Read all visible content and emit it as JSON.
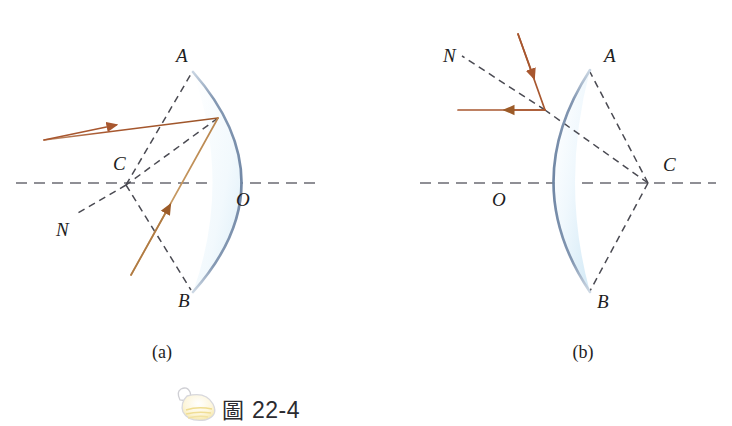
{
  "figure": {
    "caption_icon": "bulb-flask-icon",
    "caption_cjk": "圖",
    "caption_number": "22-4",
    "colors": {
      "mirror_arc": "#7b92ae",
      "lens_fill": "#e9f3fa",
      "ray_incident": "#a8572f",
      "ray_reflected": "#c79a63",
      "dashed_construction": "#4a4a52",
      "dashed_axis": "#6b6b73",
      "label_text": "#1d1d22"
    }
  },
  "panels": [
    {
      "id": "panel-a",
      "label": "(a)",
      "mirror_type": "concave",
      "points": [
        {
          "name": "A",
          "label": "A",
          "x": 176,
          "y": 62
        },
        {
          "name": "B",
          "label": "B",
          "x": 178,
          "y": 307
        },
        {
          "name": "C",
          "label": "C",
          "x": 113,
          "y": 170
        },
        {
          "name": "O",
          "label": "O",
          "x": 236,
          "y": 206
        },
        {
          "name": "N",
          "label": "N",
          "x": 56,
          "y": 236
        }
      ],
      "rays": [
        {
          "name": "incident-ray",
          "kind": "incident",
          "direction": "toward-mirror"
        },
        {
          "name": "reflected-ray",
          "kind": "reflected",
          "direction": "away-from-mirror"
        }
      ],
      "construction": [
        "radius-C-to-A",
        "radius-C-to-B",
        "normal-through-C-to-N",
        "chord-C-to-incidence-point",
        "optical-axis"
      ]
    },
    {
      "id": "panel-b",
      "label": "(b)",
      "mirror_type": "convex",
      "points": [
        {
          "name": "A",
          "label": "A",
          "x": 604,
          "y": 62
        },
        {
          "name": "B",
          "label": "B",
          "x": 597,
          "y": 308
        },
        {
          "name": "C",
          "label": "C",
          "x": 663,
          "y": 171
        },
        {
          "name": "O",
          "label": "O",
          "x": 492,
          "y": 206
        },
        {
          "name": "N",
          "label": "N",
          "x": 443,
          "y": 62
        }
      ],
      "rays": [
        {
          "name": "incident-ray",
          "kind": "incident",
          "direction": "toward-mirror"
        },
        {
          "name": "reflected-ray",
          "kind": "reflected",
          "direction": "away-from-mirror"
        }
      ],
      "construction": [
        "radius-C-to-A",
        "radius-C-to-B",
        "normal-through-incidence-point-to-N",
        "optical-axis"
      ]
    }
  ]
}
